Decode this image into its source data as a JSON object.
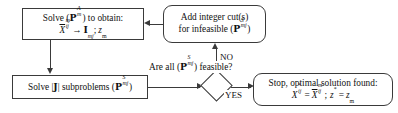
{
  "diagram": {
    "type": "flowchart",
    "background_color": "#ffffff",
    "line_color": "#3a3a3a",
    "text_color": "#111111"
  },
  "nodes": {
    "solve_master": {
      "shape": "rectangle",
      "line1_a": "Solve (",
      "line1_symbol": "P",
      "line1_sub": "m",
      "line1_sup": "A",
      "line1_b": ") to obtain:",
      "line2_x": "X",
      "line2_x_sub": "ij",
      "line2_x_sup": "m",
      "line2_arrow": "→",
      "line2_i": "I",
      "line2_i_sub": "mj",
      "line2_semicolon": ";",
      "line2_z": "z",
      "line2_z_sub": "m",
      "plain_text": "Solve (P_m^A) to obtain: X̄_ij^m → I_mj; z_m"
    },
    "add_cuts": {
      "shape": "rounded-rectangle",
      "line1": "Add integer cut(s)",
      "line2_a": "for infeasible (",
      "line2_symbol": "P",
      "line2_sub": "mj",
      "line2_sup": "S",
      "line2_b": ")",
      "plain_text": "Add integer cut(s) for infeasible (P_mj^S)"
    },
    "solve_subproblems": {
      "shape": "rectangle",
      "line1_a": "Solve |",
      "line1_j": "J",
      "line1_b": "| subproblems (",
      "line1_symbol": "P",
      "line1_sub": "mj",
      "line1_sup": "S",
      "line1_c": ")",
      "plain_text": "Solve |J| subproblems (P_mj^S)"
    },
    "decision": {
      "shape": "diamond",
      "label": "",
      "plain_text": "decision diamond (empty)"
    },
    "stop": {
      "shape": "rounded-rectangle",
      "line1": "Stop, optimal solution found:",
      "line2_x": "X",
      "line2_x_sub": "ij",
      "line2_x_sup": "*",
      "line2_eq": "=",
      "line2_xbar": "X",
      "line2_xbar_sub": "ij",
      "line2_xbar_sup": "m",
      "line2_semicolon": ";",
      "line2_z": "z",
      "line2_z_sup": "*",
      "line2_eq2": "=",
      "line2_zm": "z",
      "line2_zm_sub": "m",
      "plain_text": "Stop, optimal solution found: X*_ij = X̄_ij^m; z* = z_m"
    }
  },
  "question_label": {
    "line1_a": "Are all (",
    "line1_symbol": "P",
    "line1_sub": "mj",
    "line1_sup": "S",
    "line1_b": ")",
    "line2": "feasible?",
    "plain_text": "Are all (P_mj^S) feasible?"
  },
  "edge_labels": {
    "no": "NO",
    "yes": "YES"
  },
  "edges": [
    {
      "from": "solve_master",
      "to": "solve_subproblems",
      "direction": "down",
      "label": ""
    },
    {
      "from": "solve_subproblems",
      "to": "decision",
      "direction": "right",
      "label": ""
    },
    {
      "from": "decision",
      "to": "add_cuts",
      "direction": "up",
      "label": "NO"
    },
    {
      "from": "decision",
      "to": "stop",
      "direction": "right",
      "label": "YES"
    },
    {
      "from": "add_cuts",
      "to": "solve_master",
      "direction": "left",
      "label": ""
    }
  ]
}
